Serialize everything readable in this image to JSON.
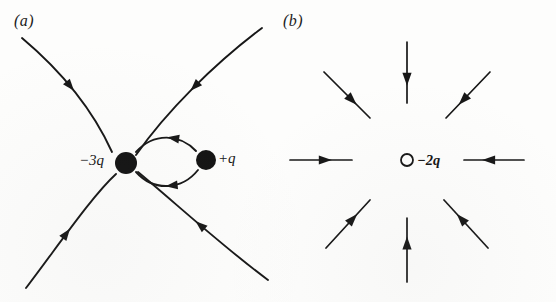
{
  "figure": {
    "background_color": "#fdfdfc",
    "ink_color": "#171717"
  },
  "panels": [
    {
      "id": "a",
      "label": "(a)",
      "description": "Electric field lines for a -3q charge and a +q charge",
      "charges": [
        {
          "name": "charge-neg-3q",
          "label": "−3q",
          "sign": "negative",
          "magnitude": "3q",
          "marker": "filled-dot",
          "cx": 126,
          "cy": 163,
          "r": 11
        },
        {
          "name": "charge-pos-q",
          "label": "+q",
          "sign": "positive",
          "magnitude": "q",
          "marker": "filled-dot",
          "cx": 206,
          "cy": 160,
          "r": 10
        }
      ],
      "field_lines": [
        {
          "name": "fieldline-upper-left",
          "path": "M 22,38 C 60,70 92,108 112,152",
          "arrow_at": 0.47,
          "direction": "inward"
        },
        {
          "name": "fieldline-lower-left",
          "path": "M 26,288 C 58,246 92,196 116,174",
          "arrow_at": 0.47,
          "direction": "inward"
        },
        {
          "name": "fieldline-upper-right",
          "path": "M 262,28 C 214,64 166,112 136,155",
          "arrow_at": 0.5,
          "direction": "inward"
        },
        {
          "name": "fieldline-lower-right",
          "path": "M 268,280 C 222,246 172,200 138,172",
          "arrow_at": 0.52,
          "direction": "inward"
        },
        {
          "name": "fieldline-loop-upper",
          "path": "M 196,151 C 180,134 154,132 136,152",
          "arrow_at": 0.4,
          "direction": "inward"
        },
        {
          "name": "fieldline-loop-lower",
          "path": "M 198,170 C 182,190 154,192 136,172",
          "arrow_at": 0.45,
          "direction": "inward"
        }
      ]
    },
    {
      "id": "b",
      "label": "(b)",
      "description": "Radial inward electric field lines for an isolated -2q point charge",
      "charges": [
        {
          "name": "charge-neg-2q",
          "label": "−2q",
          "sign": "negative",
          "magnitude": "2q",
          "marker": "open-circle",
          "cx": 129,
          "cy": 160,
          "r": 6
        }
      ],
      "rays": [
        {
          "name": "ray-north",
          "angle_deg": 90,
          "x1": 129,
          "y1": 42,
          "x2": 129,
          "y2": 103,
          "arrow_at": 0.62,
          "direction": "inward"
        },
        {
          "name": "ray-northeast",
          "angle_deg": 45,
          "x1": 212,
          "y1": 72,
          "x2": 168,
          "y2": 118,
          "arrow_at": 0.62,
          "direction": "inward"
        },
        {
          "name": "ray-east",
          "angle_deg": 0,
          "x1": 246,
          "y1": 160,
          "x2": 186,
          "y2": 160,
          "arrow_at": 0.6,
          "direction": "inward"
        },
        {
          "name": "ray-southeast",
          "angle_deg": -45,
          "x1": 210,
          "y1": 248,
          "x2": 166,
          "y2": 200,
          "arrow_at": 0.62,
          "direction": "inward"
        },
        {
          "name": "ray-south",
          "angle_deg": -90,
          "x1": 129,
          "y1": 282,
          "x2": 129,
          "y2": 218,
          "arrow_at": 0.62,
          "direction": "inward"
        },
        {
          "name": "ray-southwest",
          "angle_deg": 225,
          "x1": 48,
          "y1": 248,
          "x2": 92,
          "y2": 200,
          "arrow_at": 0.62,
          "direction": "inward"
        },
        {
          "name": "ray-west",
          "angle_deg": 180,
          "x1": 12,
          "y1": 160,
          "x2": 74,
          "y2": 160,
          "arrow_at": 0.58,
          "direction": "inward"
        },
        {
          "name": "ray-northwest",
          "angle_deg": 135,
          "x1": 46,
          "y1": 72,
          "x2": 92,
          "y2": 118,
          "arrow_at": 0.62,
          "direction": "inward"
        }
      ]
    }
  ]
}
